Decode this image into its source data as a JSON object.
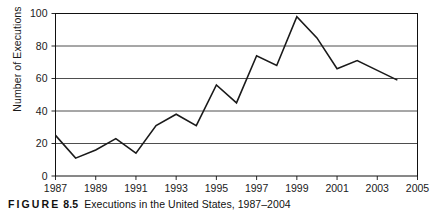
{
  "caption": {
    "figure_word": "FIGURE",
    "figure_number": "8.5",
    "text": "Executions in the United States, 1987–2004"
  },
  "axis": {
    "ylabel": "Number of Executions",
    "xlabel": ""
  },
  "chart_data": {
    "type": "line",
    "title": "",
    "subtitle": "",
    "xlabel": "",
    "ylabel": "Number of Executions",
    "xlim": [
      1987,
      2005
    ],
    "ylim": [
      0,
      100
    ],
    "grid": true,
    "grid_axis": "y",
    "legend": false,
    "legend_position": "none",
    "line_color": "#1a1a1a",
    "x": [
      1987,
      1988,
      1989,
      1990,
      1991,
      1992,
      1993,
      1994,
      1995,
      1996,
      1997,
      1998,
      1999,
      2000,
      2001,
      2002,
      2003,
      2004
    ],
    "values": [
      25,
      11,
      16,
      23,
      14,
      31,
      38,
      31,
      56,
      45,
      74,
      68,
      98,
      85,
      66,
      71,
      65,
      59
    ],
    "series": [
      {
        "name": "Executions",
        "values": [
          25,
          11,
          16,
          23,
          14,
          31,
          38,
          31,
          56,
          45,
          74,
          68,
          98,
          85,
          66,
          71,
          65,
          59
        ]
      }
    ],
    "ytick_values": [
      0,
      20,
      40,
      60,
      80,
      100
    ],
    "ytick_labels": [
      "0",
      "20",
      "40",
      "60",
      "80",
      "100"
    ],
    "xtick_values": [
      1987,
      1989,
      1991,
      1993,
      1995,
      1997,
      1999,
      2001,
      2003,
      2005
    ],
    "xtick_labels": [
      "1987",
      "1989",
      "1991",
      "1993",
      "1995",
      "1997",
      "1999",
      "2001",
      "2003",
      "2005"
    ]
  }
}
